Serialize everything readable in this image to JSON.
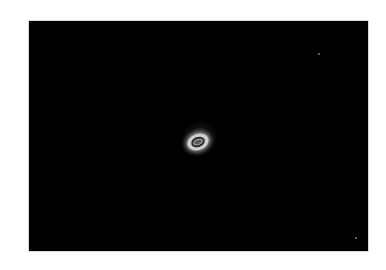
{
  "image": {
    "description": "Dark field image with a single bright elliptical ring-shaped object near center",
    "background_color": "#000000",
    "border_color": "#d8d8d8",
    "page_background": "#ffffff",
    "object": {
      "shape": "ellipse ring with bright core",
      "center": [
        198,
        143
      ],
      "outer_color": "#cfcfcf",
      "inner_color": "#2a2a2a"
    },
    "specks": [
      {
        "x": 318,
        "y": 53
      },
      {
        "x": 355,
        "y": 237
      }
    ]
  }
}
